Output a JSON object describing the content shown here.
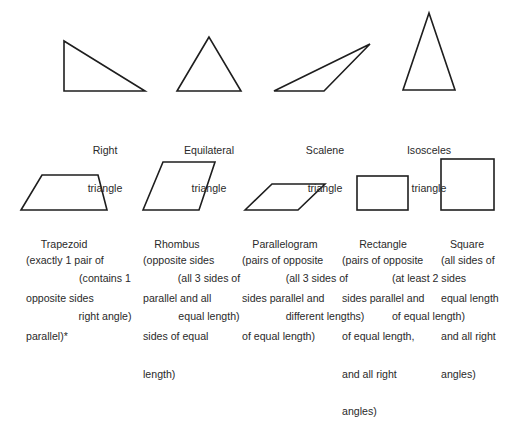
{
  "triangles": [
    {
      "id": "right",
      "name_lines": [
        "Right",
        "triangle"
      ],
      "desc_lines": [
        "(contains 1",
        "right angle)"
      ],
      "points": "64,41 64,91 145,91"
    },
    {
      "id": "equilateral",
      "name_lines": [
        "Equilateral",
        "triangle"
      ],
      "desc_lines": [
        "(all 3 sides of",
        "equal length)"
      ],
      "points": "209,37 177,91 241,91"
    },
    {
      "id": "scalene",
      "name_lines": [
        "Scalene",
        "triangle"
      ],
      "desc_lines": [
        "(all 3 sides of",
        "different lengths)"
      ],
      "points": "274,91 370,44 324,91"
    },
    {
      "id": "isosceles",
      "name_lines": [
        "Isosceles",
        "triangle"
      ],
      "desc_lines": [
        "(at least 2 sides",
        "of equal length)"
      ],
      "points": "429,13 403,90 455,90"
    }
  ],
  "quadrilaterals": [
    {
      "id": "trapezoid",
      "name": "Trapezoid",
      "desc_lines": [
        "(exactly 1 pair of",
        "opposite sides",
        "parallel)*"
      ],
      "points": "21,210 42,175 98,175 107,210"
    },
    {
      "id": "rhombus",
      "name": "Rhombus",
      "desc_lines": [
        "(opposite sides",
        "parallel and all",
        "sides of equal",
        "length)"
      ],
      "points": "143,210 163,162 215,162 199,210"
    },
    {
      "id": "parallelogram",
      "name": "Parallelogram",
      "desc_lines": [
        "(pairs of opposite",
        "sides parallel and",
        "of equal length)"
      ],
      "points": "245,210 272,184 325,184 298,210"
    },
    {
      "id": "rectangle",
      "name": "Rectangle",
      "desc_lines": [
        "(pairs of opposite",
        "sides parallel and",
        "of equal length,",
        "and all right",
        "angles)"
      ],
      "rect": {
        "x": 357,
        "y": 176,
        "w": 51,
        "h": 34
      }
    },
    {
      "id": "square",
      "name": "Square",
      "desc_lines": [
        "(all sides of",
        "equal length",
        "and all right",
        "angles)"
      ],
      "rect": {
        "x": 441,
        "y": 159,
        "w": 53,
        "h": 51
      }
    }
  ],
  "colors": {
    "stroke": "#1e1e1e",
    "text": "#2a2a2a",
    "background": "#ffffff"
  }
}
